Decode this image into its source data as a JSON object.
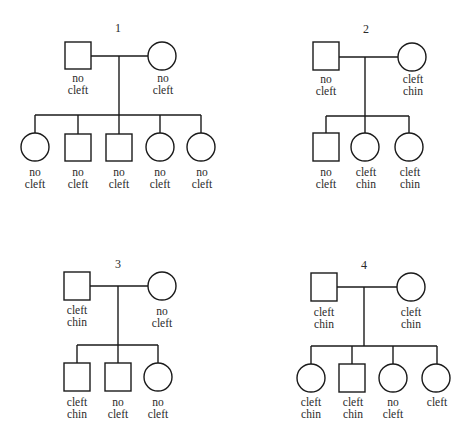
{
  "pedigrees": [
    {
      "number": "1",
      "father": {
        "sex": "male",
        "label": [
          "no",
          "cleft"
        ]
      },
      "mother": {
        "sex": "female",
        "label": [
          "no",
          "cleft"
        ]
      },
      "children": [
        {
          "sex": "female",
          "label": [
            "no",
            "cleft"
          ]
        },
        {
          "sex": "male",
          "label": [
            "no",
            "cleft"
          ]
        },
        {
          "sex": "male",
          "label": [
            "no",
            "cleft"
          ]
        },
        {
          "sex": "female",
          "label": [
            "no",
            "cleft"
          ]
        },
        {
          "sex": "female",
          "label": [
            "no",
            "cleft"
          ]
        }
      ]
    },
    {
      "number": "2",
      "father": {
        "sex": "male",
        "label": [
          "no",
          "cleft"
        ]
      },
      "mother": {
        "sex": "female",
        "label": [
          "cleft",
          "chin"
        ]
      },
      "children": [
        {
          "sex": "male",
          "label": [
            "no",
            "cleft"
          ]
        },
        {
          "sex": "female",
          "label": [
            "cleft",
            "chin"
          ]
        },
        {
          "sex": "female",
          "label": [
            "cleft",
            "chin"
          ]
        }
      ]
    },
    {
      "number": "3",
      "father": {
        "sex": "male",
        "label": [
          "cleft",
          "chin"
        ]
      },
      "mother": {
        "sex": "female",
        "label": [
          "no",
          "cleft"
        ]
      },
      "children": [
        {
          "sex": "male",
          "label": [
            "cleft",
            "chin"
          ]
        },
        {
          "sex": "male",
          "label": [
            "no",
            "cleft"
          ]
        },
        {
          "sex": "female",
          "label": [
            "no",
            "cleft"
          ]
        }
      ]
    },
    {
      "number": "4",
      "father": {
        "sex": "male",
        "label": [
          "cleft",
          "chin"
        ]
      },
      "mother": {
        "sex": "female",
        "label": [
          "cleft",
          "chin"
        ]
      },
      "children": [
        {
          "sex": "female",
          "label": [
            "cleft",
            "chin"
          ]
        },
        {
          "sex": "male",
          "label": [
            "cleft",
            "chin"
          ]
        },
        {
          "sex": "female",
          "label": [
            "no",
            "cleft"
          ]
        },
        {
          "sex": "female",
          "label": [
            "cleft",
            ""
          ]
        }
      ]
    }
  ]
}
